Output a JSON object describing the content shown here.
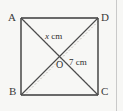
{
  "figure": {
    "kind": "geometry-diagram",
    "shape": "square",
    "background_color": "#f7f7f5",
    "stroke_color": "#3a3a3a",
    "ghost_stroke_color": "#c0bcb8"
  },
  "vertices": [
    {
      "id": "A",
      "label": "A",
      "position": "top-left",
      "x": 21,
      "y": 18
    },
    {
      "id": "D",
      "label": "D",
      "position": "top-right",
      "x": 98,
      "y": 18
    },
    {
      "id": "B",
      "label": "B",
      "position": "bottom-left",
      "x": 21,
      "y": 95
    },
    {
      "id": "C",
      "label": "C",
      "position": "bottom-right",
      "x": 98,
      "y": 95
    }
  ],
  "centre": {
    "id": "O",
    "label": "O",
    "x": 60,
    "y": 62
  },
  "measurements": [
    {
      "id": "half-diagonal-upper",
      "variable": "x",
      "unit": "cm",
      "text": "x cm",
      "on_segment": "AO"
    },
    {
      "id": "half-diagonal-lower-right",
      "value": "7",
      "unit": "cm",
      "text": "7 cm",
      "on_segment": "OC"
    }
  ],
  "edges": [
    {
      "id": "AD",
      "from": "A",
      "to": "D",
      "style": "solid"
    },
    {
      "id": "DC",
      "from": "D",
      "to": "C",
      "style": "solid"
    },
    {
      "id": "CB",
      "from": "C",
      "to": "B",
      "style": "solid"
    },
    {
      "id": "BA",
      "from": "B",
      "to": "A",
      "style": "solid"
    }
  ],
  "diagonals": [
    {
      "id": "AC",
      "from": "A",
      "to": "C",
      "style": "solid"
    },
    {
      "id": "BD",
      "from": "B",
      "to": "D",
      "style": "solid"
    },
    {
      "id": "AC-ghost",
      "from": "A",
      "to": "C",
      "style": "dashed-faint"
    },
    {
      "id": "BD-ghost",
      "from": "B",
      "to": "D",
      "style": "dashed-faint"
    }
  ],
  "right_edge_rule": {
    "id": "page-edge-rule",
    "color": "#c9c9c9"
  }
}
